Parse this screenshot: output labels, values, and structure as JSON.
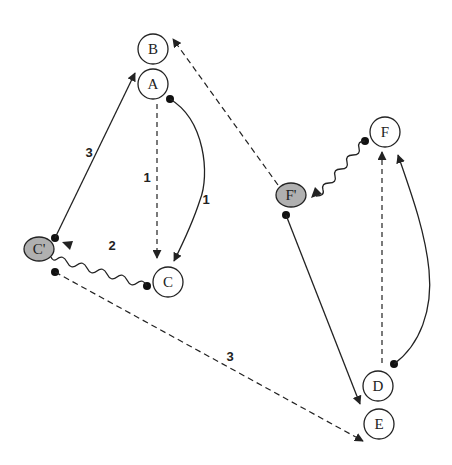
{
  "diagram": {
    "colors": {
      "stroke": "#222222",
      "node_fill": "#ffffff",
      "shadow_fill": "#b0b0b0",
      "background": "#ffffff"
    },
    "nodes": [
      {
        "id": "B",
        "label": "B",
        "x": 153,
        "y": 49,
        "type": "circle"
      },
      {
        "id": "A",
        "label": "A",
        "x": 153,
        "y": 84,
        "type": "circle"
      },
      {
        "id": "C",
        "label": "C",
        "x": 168,
        "y": 282,
        "type": "circle"
      },
      {
        "id": "Cp",
        "label": "C'",
        "x": 39,
        "y": 249,
        "type": "shaded-ellipse"
      },
      {
        "id": "F",
        "label": "F",
        "x": 385,
        "y": 132,
        "type": "circle"
      },
      {
        "id": "Fp",
        "label": "F'",
        "x": 291,
        "y": 195,
        "type": "shaded-ellipse"
      },
      {
        "id": "D",
        "label": "D",
        "x": 378,
        "y": 386,
        "type": "circle"
      },
      {
        "id": "E",
        "label": "E",
        "x": 379,
        "y": 424,
        "type": "circle"
      }
    ],
    "edge_labels": [
      {
        "id": "label-A-C-dashed",
        "text": "1",
        "x": 147,
        "y": 182
      },
      {
        "id": "label-A-C-curve",
        "text": "1",
        "x": 206,
        "y": 204
      },
      {
        "id": "label-C-Cp-wavy",
        "text": "2",
        "x": 112,
        "y": 250
      },
      {
        "id": "label-Cp-A",
        "text": "3",
        "x": 89,
        "y": 157
      },
      {
        "id": "label-Cp-E",
        "text": "3",
        "x": 230,
        "y": 361
      }
    ]
  }
}
